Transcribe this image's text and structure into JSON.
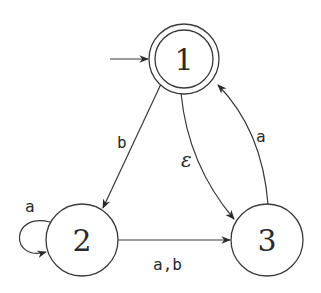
{
  "diagram": {
    "type": "finite-automaton",
    "start_state": "1",
    "accepting_states": [
      "1"
    ],
    "states": [
      {
        "id": "1",
        "label": "1",
        "accepting": true
      },
      {
        "id": "2",
        "label": "2",
        "accepting": false
      },
      {
        "id": "3",
        "label": "3",
        "accepting": false
      }
    ],
    "transitions": [
      {
        "from": "1",
        "to": "2",
        "label": "b"
      },
      {
        "from": "1",
        "to": "3",
        "label": "ε"
      },
      {
        "from": "3",
        "to": "1",
        "label": "a"
      },
      {
        "from": "2",
        "to": "2",
        "label": "a"
      },
      {
        "from": "2",
        "to": "3",
        "label": "a,b"
      }
    ]
  }
}
